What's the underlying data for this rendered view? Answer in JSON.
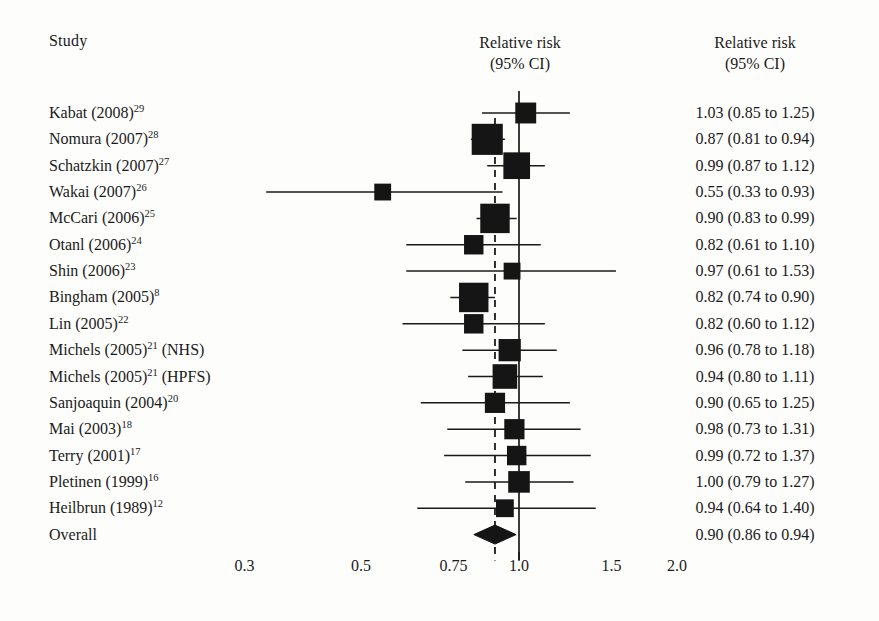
{
  "header": {
    "study_col": "Study",
    "plot_title_line1": "Relative risk",
    "plot_title_line2": "(95% CI)",
    "value_col_line1": "Relative risk",
    "value_col_line2": "(95% CI)"
  },
  "axis": {
    "ticks": [
      {
        "label": "0.3",
        "value": 0.3
      },
      {
        "label": "0.5",
        "value": 0.5
      },
      {
        "label": "0.75",
        "value": 0.75
      },
      {
        "label": "1.0",
        "value": 1.0
      },
      {
        "label": "1.5",
        "value": 1.5
      },
      {
        "label": "2.0",
        "value": 2.0
      }
    ],
    "scale": "log",
    "null_line": 1.0,
    "pooled_line": 0.9
  },
  "colors": {
    "ink": "#1a1a1a",
    "marker": "#151515",
    "background": "#fdfdfc"
  },
  "chart_data": {
    "type": "forest",
    "title": "Relative risk (95% CI)",
    "xlabel": "Relative risk",
    "ylabel": "Study",
    "xscale": "log",
    "xlim": [
      0.28,
      2.2
    ],
    "grid": false,
    "legend": "none",
    "null_reference": 1.0,
    "pooled_reference": 0.9,
    "xticks": [
      0.3,
      0.5,
      0.75,
      1.0,
      1.5,
      2.0
    ],
    "xticklabels": [
      "0.3",
      "0.5",
      "0.75",
      "1.0",
      "1.5",
      "2.0"
    ],
    "rows": [
      {
        "study": "Kabat (2008)",
        "ref": "29",
        "rr": 1.03,
        "lo": 0.85,
        "hi": 1.25,
        "text": "1.03 (0.85 to 1.25)",
        "weight": 10,
        "type": "study"
      },
      {
        "study": "Nomura (2007)",
        "ref": "28",
        "rr": 0.87,
        "lo": 0.81,
        "hi": 0.94,
        "text": "0.87 (0.81 to 0.94)",
        "weight": 30,
        "type": "study"
      },
      {
        "study": "Schatzkin (2007)",
        "ref": "27",
        "rr": 0.99,
        "lo": 0.87,
        "hi": 1.12,
        "text": "0.99 (0.87 to 1.12)",
        "weight": 20,
        "type": "study"
      },
      {
        "study": "Wakai (2007)",
        "ref": "26",
        "rr": 0.55,
        "lo": 0.33,
        "hi": 0.93,
        "text": "0.55 (0.33 to 0.93)",
        "weight": 5,
        "type": "study"
      },
      {
        "study": "McCari (2006)",
        "ref": "25",
        "rr": 0.9,
        "lo": 0.83,
        "hi": 0.99,
        "text": "0.90 (0.83 to 0.99)",
        "weight": 26,
        "type": "study"
      },
      {
        "study": "Otanl (2006)",
        "ref": "24",
        "rr": 0.82,
        "lo": 0.61,
        "hi": 1.1,
        "text": "0.82 (0.61 to 1.10)",
        "weight": 8,
        "type": "study"
      },
      {
        "study": "Shin (2006)",
        "ref": "23",
        "rr": 0.97,
        "lo": 0.61,
        "hi": 1.53,
        "text": "0.97 (0.61 to 1.53)",
        "weight": 5,
        "type": "study"
      },
      {
        "study": "Bingham (2005)",
        "ref": "8",
        "rr": 0.82,
        "lo": 0.74,
        "hi": 0.9,
        "text": "0.82 (0.74 to 0.90)",
        "weight": 26,
        "type": "study"
      },
      {
        "study": "Lin (2005)",
        "ref": "22",
        "rr": 0.82,
        "lo": 0.6,
        "hi": 1.12,
        "text": "0.82 (0.60 to 1.12)",
        "weight": 8,
        "type": "study"
      },
      {
        "study": "Michels (2005)",
        "ref": "21",
        "suffix": " (NHS)",
        "rr": 0.96,
        "lo": 0.78,
        "hi": 1.18,
        "text": "0.96 (0.78 to 1.18)",
        "weight": 12,
        "type": "study"
      },
      {
        "study": "Michels (2005)",
        "ref": "21",
        "suffix": " (HPFS)",
        "rr": 0.94,
        "lo": 0.8,
        "hi": 1.11,
        "text": "0.94 (0.80 to 1.11)",
        "weight": 16,
        "type": "study"
      },
      {
        "study": "Sanjoaquin (2004)",
        "ref": "20",
        "rr": 0.9,
        "lo": 0.65,
        "hi": 1.25,
        "text": "0.90 (0.65 to 1.25)",
        "weight": 9,
        "type": "study"
      },
      {
        "study": "Mai (2003)",
        "ref": "18",
        "rr": 0.98,
        "lo": 0.73,
        "hi": 1.31,
        "text": "0.98 (0.73 to 1.31)",
        "weight": 9,
        "type": "study"
      },
      {
        "study": "Terry (2001)",
        "ref": "17",
        "rr": 0.99,
        "lo": 0.72,
        "hi": 1.37,
        "text": "0.99 (0.72 to 1.37)",
        "weight": 8,
        "type": "study"
      },
      {
        "study": "Pletinen (1999)",
        "ref": "16",
        "rr": 1.0,
        "lo": 0.79,
        "hi": 1.27,
        "text": "1.00 (0.79 to 1.27)",
        "weight": 11,
        "type": "study"
      },
      {
        "study": "Heilbrun (1989)",
        "ref": "12",
        "rr": 0.94,
        "lo": 0.64,
        "hi": 1.4,
        "text": "0.94 (0.64 to 1.40)",
        "weight": 6,
        "type": "study"
      },
      {
        "study": "Overall",
        "ref": "",
        "rr": 0.9,
        "lo": 0.86,
        "hi": 0.94,
        "text": "0.90 (0.86 to 0.94)",
        "weight": 0,
        "type": "summary"
      }
    ]
  }
}
